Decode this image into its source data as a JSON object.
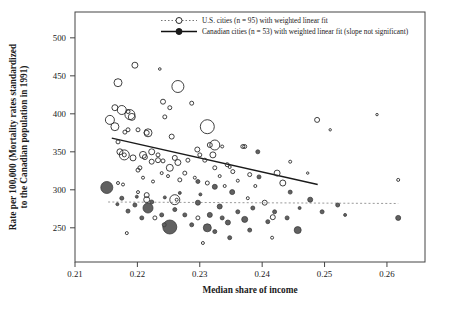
{
  "figure": {
    "background": "#ffffff",
    "plot_border_color": "#444444"
  },
  "legend": {
    "us": {
      "label": "U.S. cities (n = 95) with weighted linear fit",
      "marker": "open-circle",
      "line_style": "dotted",
      "line_color": "#777777",
      "marker_stroke": "#2b2b2b"
    },
    "canada": {
      "label": "Canadian cities (n = 53) with weighted linear fit (slope not significant)",
      "marker": "filled-circle",
      "line_style": "solid",
      "line_color": "#111111",
      "marker_fill": "#1a1a1a"
    }
  },
  "chart_data": {
    "type": "scatter",
    "title": "",
    "xlabel": "Median share of income",
    "ylabel_line1": "Rate per 100,000 (Mortality rates standardized",
    "ylabel_line2": "to the Canadian population in 1991)",
    "x_ticks": [
      "0.21",
      "0.22",
      "0.23",
      "0.24",
      "0.25",
      "0.26"
    ],
    "x_tick_values": [
      0.21,
      0.22,
      0.23,
      0.24,
      0.25,
      0.26
    ],
    "y_ticks": [
      "250",
      "300",
      "350",
      "400",
      "450",
      "500"
    ],
    "y_tick_values": [
      250,
      300,
      350,
      400,
      450,
      500
    ],
    "xlim": [
      0.21,
      0.2661
    ],
    "ylim": [
      205,
      534
    ],
    "grid": false,
    "legend_position": "top-inside",
    "bubble_note": "marker size proportional to city population; r = on-screen pixel radius",
    "series": [
      {
        "name": "U.S. cities",
        "n": 95,
        "marker": "open",
        "stroke": "#2b2b2b",
        "fill": "none",
        "fit_line": {
          "x1": 0.2159,
          "y1": 368,
          "x2": 0.2489,
          "y2": 307,
          "style": "solid",
          "color": "#1a1a1a",
          "width": 1.3
        },
        "points": [
          [
            0.2196,
            464,
            3
          ],
          [
            0.2236,
            459,
            1.3
          ],
          [
            0.2169,
            441,
            4
          ],
          [
            0.2265,
            436,
            6
          ],
          [
            0.2241,
            416,
            2.5
          ],
          [
            0.2252,
            408,
            2
          ],
          [
            0.2287,
            414,
            2
          ],
          [
            0.2164,
            408,
            3
          ],
          [
            0.2175,
            405,
            4.5
          ],
          [
            0.2188,
            399,
            5
          ],
          [
            0.2244,
            396,
            2
          ],
          [
            0.2156,
            392,
            4.5
          ],
          [
            0.2312,
            383,
            7
          ],
          [
            0.218,
            376,
            2
          ],
          [
            0.2201,
            379,
            2
          ],
          [
            0.2217,
            375,
            4
          ],
          [
            0.2255,
            370,
            2.5
          ],
          [
            0.2324,
            359,
            5
          ],
          [
            0.2372,
            357,
            2
          ],
          [
            0.2488,
            392,
            2.5
          ],
          [
            0.2185,
            403,
            2
          ],
          [
            0.2191,
            396,
            3.5
          ],
          [
            0.2164,
            383,
            4
          ],
          [
            0.2185,
            379,
            2
          ],
          [
            0.2215,
            375,
            2.5
          ],
          [
            0.2584,
            399,
            1.2
          ],
          [
            0.2509,
            379,
            1.2
          ],
          [
            0.2172,
            350,
            3
          ],
          [
            0.2179,
            346,
            5
          ],
          [
            0.2179,
            346,
            2
          ],
          [
            0.2193,
            342,
            3
          ],
          [
            0.2209,
            346,
            3.5
          ],
          [
            0.2233,
            339,
            2.5
          ],
          [
            0.2241,
            338,
            2
          ],
          [
            0.226,
            342,
            2.5
          ],
          [
            0.2265,
            336,
            3
          ],
          [
            0.2281,
            339,
            2
          ],
          [
            0.2316,
            359,
            2.5
          ],
          [
            0.2321,
            346,
            3
          ],
          [
            0.2336,
            357,
            1.5
          ],
          [
            0.2344,
            333,
            2
          ],
          [
            0.2348,
            330,
            1.5
          ],
          [
            0.2252,
            329,
            3.5
          ],
          [
            0.2268,
            313,
            2
          ],
          [
            0.2201,
            326,
            2
          ],
          [
            0.2209,
            316,
            1.5
          ],
          [
            0.2225,
            311,
            1.5
          ],
          [
            0.2223,
            350,
            3
          ],
          [
            0.2212,
            343,
            2.5
          ],
          [
            0.2223,
            337,
            2.5
          ],
          [
            0.2233,
            346,
            2
          ],
          [
            0.2204,
            329,
            2
          ],
          [
            0.2169,
            363,
            2
          ],
          [
            0.2296,
            353,
            2.5
          ],
          [
            0.23,
            346,
            2
          ],
          [
            0.2308,
            339,
            2
          ],
          [
            0.2169,
            309,
            1.5
          ],
          [
            0.2177,
            307,
            1.5
          ],
          [
            0.2201,
            297,
            1.5
          ],
          [
            0.2215,
            293,
            2.5
          ],
          [
            0.2369,
            357,
            2
          ],
          [
            0.226,
            287,
            5
          ],
          [
            0.2263,
            287,
            1.5
          ],
          [
            0.2215,
            287,
            3
          ],
          [
            0.2424,
            322,
            3
          ],
          [
            0.2433,
            309,
            3
          ],
          [
            0.2445,
            337,
            1.5
          ],
          [
            0.2404,
            283,
            2.5
          ],
          [
            0.2417,
            264,
            2.5
          ],
          [
            0.2473,
            322,
            1.2
          ],
          [
            0.2416,
            237,
            1.5
          ],
          [
            0.2618,
            313,
            1.5
          ],
          [
            0.2228,
            263,
            2
          ],
          [
            0.2183,
            243,
            1.5
          ],
          [
            0.2305,
            230,
            1.5
          ],
          [
            0.2297,
            263,
            2
          ],
          [
            0.2377,
            289,
            1.5
          ],
          [
            0.2239,
            322,
            1.5
          ],
          [
            0.2249,
            318,
            1.5
          ],
          [
            0.2276,
            322,
            2
          ],
          [
            0.2292,
            316,
            1.5
          ],
          [
            0.2312,
            309,
            2
          ],
          [
            0.2332,
            318,
            1.5
          ],
          [
            0.234,
            305,
            1.5
          ],
          [
            0.2361,
            312,
            1.5
          ],
          [
            0.238,
            320,
            2
          ],
          [
            0.2389,
            305,
            1.5
          ],
          [
            0.2353,
            324,
            2
          ],
          [
            0.2324,
            329,
            2
          ]
        ]
      },
      {
        "name": "Canadian cities",
        "n": 53,
        "marker": "filled",
        "stroke": "#3d3d3d",
        "fill": "#616161",
        "fit_line": {
          "x1": 0.2153,
          "y1": 284,
          "x2": 0.2618,
          "y2": 282,
          "style": "dashed",
          "color": "#9a9a9a",
          "width": 1
        },
        "points": [
          [
            0.2151,
            303,
            6
          ],
          [
            0.2217,
            276,
            5
          ],
          [
            0.2252,
            251,
            7
          ],
          [
            0.2312,
            250,
            4
          ],
          [
            0.2297,
            283,
            2.5
          ],
          [
            0.2316,
            267,
            2.5
          ],
          [
            0.2332,
            278,
            2.5
          ],
          [
            0.2345,
            257,
            2.5
          ],
          [
            0.2372,
            261,
            3
          ],
          [
            0.2457,
            247,
            3.5
          ],
          [
            0.2618,
            263,
            2.5
          ],
          [
            0.2393,
            350,
            2
          ],
          [
            0.2395,
            317,
            2
          ],
          [
            0.2445,
            297,
            2
          ],
          [
            0.2297,
            311,
            2
          ],
          [
            0.2324,
            304,
            2.5
          ],
          [
            0.2352,
            297,
            2.5
          ],
          [
            0.2223,
            284,
            2
          ],
          [
            0.226,
            274,
            2
          ],
          [
            0.2276,
            267,
            2
          ],
          [
            0.2287,
            254,
            2
          ],
          [
            0.2239,
            267,
            2
          ],
          [
            0.2196,
            280,
            2
          ],
          [
            0.2336,
            263,
            2
          ],
          [
            0.2361,
            271,
            2
          ],
          [
            0.2385,
            276,
            2
          ],
          [
            0.2409,
            258,
            2
          ],
          [
            0.2477,
            287,
            2.5
          ],
          [
            0.2496,
            271,
            2
          ],
          [
            0.2521,
            280,
            2
          ],
          [
            0.2175,
            289,
            2
          ],
          [
            0.238,
            247,
            2
          ],
          [
            0.2207,
            263,
            2
          ],
          [
            0.2185,
            272,
            2
          ],
          [
            0.2324,
            245,
            2
          ],
          [
            0.2348,
            237,
            2
          ],
          [
            0.2268,
            296,
            1.5
          ],
          [
            0.2244,
            290,
            1.5
          ],
          [
            0.2301,
            294,
            1.5
          ],
          [
            0.242,
            271,
            2
          ],
          [
            0.244,
            263,
            2
          ],
          [
            0.246,
            276,
            1.5
          ],
          [
            0.2533,
            267,
            1.5
          ],
          [
            0.2243,
            254,
            2
          ],
          [
            0.2168,
            281,
            1.5
          ],
          [
            0.2199,
            291,
            1.5
          ]
        ]
      }
    ]
  }
}
